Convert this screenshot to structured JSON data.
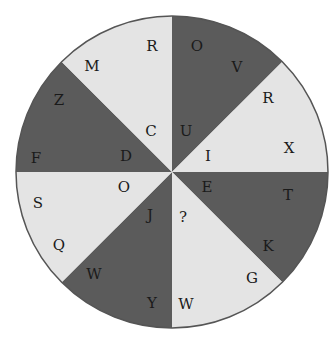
{
  "puzzle": {
    "type": "letter-wheel",
    "center": [
      172,
      172
    ],
    "radius": 156,
    "colors": {
      "dark": "#5b5b5b",
      "light": "#e4e4e4",
      "outline": "#555555",
      "text": "#1a1a1a"
    },
    "segments": [
      {
        "id": "top-right",
        "shade": "dark",
        "letters": [
          {
            "char": "O",
            "x": 197,
            "y": 46
          },
          {
            "char": "V",
            "x": 237,
            "y": 67
          },
          {
            "char": "U",
            "x": 186,
            "y": 131
          }
        ]
      },
      {
        "id": "right-upper",
        "shade": "light",
        "letters": [
          {
            "char": "R",
            "x": 268,
            "y": 98
          },
          {
            "char": "X",
            "x": 289,
            "y": 148
          },
          {
            "char": "I",
            "x": 208,
            "y": 156
          }
        ]
      },
      {
        "id": "right-lower",
        "shade": "dark",
        "letters": [
          {
            "char": "E",
            "x": 207,
            "y": 187
          },
          {
            "char": "T",
            "x": 288,
            "y": 195
          },
          {
            "char": "K",
            "x": 268,
            "y": 246
          }
        ]
      },
      {
        "id": "bottom-right",
        "shade": "light",
        "letters": [
          {
            "char": "?",
            "x": 183,
            "y": 217
          },
          {
            "char": "G",
            "x": 252,
            "y": 278
          },
          {
            "char": "W",
            "x": 186,
            "y": 304
          }
        ]
      },
      {
        "id": "bottom-left",
        "shade": "dark",
        "letters": [
          {
            "char": "J",
            "x": 150,
            "y": 215
          },
          {
            "char": "W",
            "x": 94,
            "y": 274
          },
          {
            "char": "Y",
            "x": 152,
            "y": 303
          }
        ]
      },
      {
        "id": "left-lower",
        "shade": "light",
        "letters": [
          {
            "char": "O",
            "x": 124,
            "y": 187
          },
          {
            "char": "S",
            "x": 38,
            "y": 203
          },
          {
            "char": "Q",
            "x": 59,
            "y": 245
          }
        ]
      },
      {
        "id": "left-upper",
        "shade": "dark",
        "letters": [
          {
            "char": "D",
            "x": 126,
            "y": 156
          },
          {
            "char": "F",
            "x": 36,
            "y": 158
          },
          {
            "char": "Z",
            "x": 59,
            "y": 100
          }
        ]
      },
      {
        "id": "top-left",
        "shade": "light",
        "letters": [
          {
            "char": "M",
            "x": 92,
            "y": 66
          },
          {
            "char": "R",
            "x": 152,
            "y": 46
          },
          {
            "char": "C",
            "x": 151,
            "y": 131
          }
        ]
      }
    ]
  }
}
